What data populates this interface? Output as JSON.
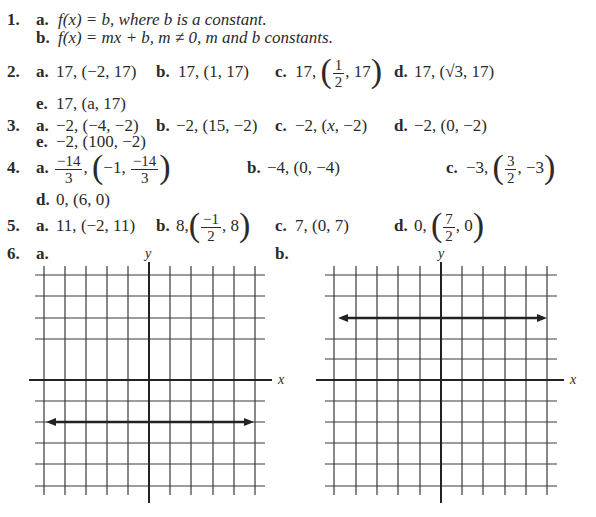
{
  "problems": [
    {
      "number": "1.",
      "parts": [
        {
          "label": "a.",
          "text": "f(x) = b, where b is a constant."
        },
        {
          "label": "b.",
          "text": "f(x) = mx + b, m ≠ 0, m and b constants."
        }
      ]
    },
    {
      "number": "2.",
      "parts": [
        {
          "label": "a.",
          "value": "17,",
          "point": "(−2, 17)"
        },
        {
          "label": "b.",
          "value": "17,",
          "point": "(1, 17)"
        },
        {
          "label": "c.",
          "value": "17,",
          "point_x_num": "1",
          "point_x_den": "2",
          "point_y": "17"
        },
        {
          "label": "d.",
          "value": "17,",
          "point": "(√3, 17)"
        },
        {
          "label": "e.",
          "value": "17,",
          "point": "(a, 17)"
        }
      ]
    },
    {
      "number": "3.",
      "parts": [
        {
          "label": "a.",
          "value": "−2,",
          "point": "(−4, −2)"
        },
        {
          "label": "b.",
          "value": "−2,",
          "point": "(15, −2)"
        },
        {
          "label": "c.",
          "value": "−2,",
          "point_x": "x",
          "point_y": "−2"
        },
        {
          "label": "d.",
          "value": "−2,",
          "point": "(0, −2)"
        },
        {
          "label": "e.",
          "value": "−2,",
          "point": "(100, −2)"
        }
      ]
    },
    {
      "number": "4.",
      "parts": [
        {
          "label": "a.",
          "value_num": "−14",
          "value_den": "3",
          "point_x": "−1",
          "point_y_num": "−14",
          "point_y_den": "3"
        },
        {
          "label": "b.",
          "value": "−4,",
          "point": "(0, −4)"
        },
        {
          "label": "c.",
          "value": "−3,",
          "point_x_num": "3",
          "point_x_den": "2",
          "point_y": "−3"
        },
        {
          "label": "d.",
          "value": "0,",
          "point": "(6, 0)"
        }
      ]
    },
    {
      "number": "5.",
      "parts": [
        {
          "label": "a.",
          "value": "11,",
          "point": "(−2, 11)"
        },
        {
          "label": "b.",
          "value": "8,",
          "point_x_num": "−1",
          "point_x_den": "2",
          "point_y": "8"
        },
        {
          "label": "c.",
          "value": "7,",
          "point": "(0, 7)"
        },
        {
          "label": "d.",
          "value": "0,",
          "point_x_num": "7",
          "point_x_den": "2",
          "point_y": "0"
        }
      ]
    },
    {
      "number": "6.",
      "parts": [
        {
          "label": "a.",
          "graph": {
            "x_axis_label": "x",
            "y_axis_label": "y",
            "line": "y = -2",
            "line_y": -2
          }
        },
        {
          "label": "b.",
          "graph": {
            "x_axis_label": "x",
            "y_axis_label": "y",
            "line": "y = 3",
            "line_y": 3
          }
        }
      ]
    }
  ],
  "colors": {
    "ink": "#2a2a2a",
    "grid": "#3a3a3a",
    "paper": "#ffffff"
  }
}
